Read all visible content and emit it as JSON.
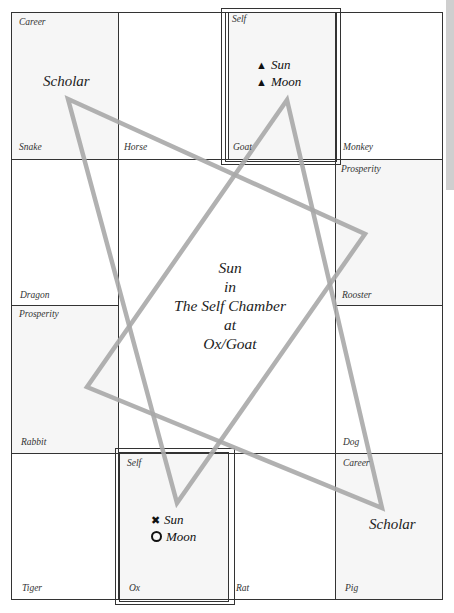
{
  "grid": {
    "cells": [
      {
        "animal": "Snake",
        "chamber": "Career"
      },
      {
        "animal": "Horse",
        "chamber": ""
      },
      {
        "animal": "Goat",
        "chamber": "Self"
      },
      {
        "animal": "Monkey",
        "chamber": ""
      },
      {
        "animal": "Dragon",
        "chamber": ""
      },
      {
        "animal": "Rooster",
        "chamber": "Prosperity"
      },
      {
        "animal": "Rabbit",
        "chamber": "Prosperity"
      },
      {
        "animal": "Dog",
        "chamber": ""
      },
      {
        "animal": "Tiger",
        "chamber": ""
      },
      {
        "animal": "Ox",
        "chamber": "Self"
      },
      {
        "animal": "Rat",
        "chamber": ""
      },
      {
        "animal": "Pig",
        "chamber": "Career"
      }
    ]
  },
  "scholar_top": "Scholar",
  "scholar_bottom": "Scholar",
  "goat_planets": [
    {
      "symbol": "▲",
      "name": "Sun"
    },
    {
      "symbol": "▲",
      "name": "Moon"
    }
  ],
  "ox_planets": [
    {
      "symbol": "✖",
      "name": "Sun"
    },
    {
      "symbol": "ring",
      "name": "Moon"
    }
  ],
  "center_text": [
    "Sun",
    "in",
    "The Self Chamber",
    "at",
    "Ox/Goat"
  ],
  "colors": {
    "star_lines": "#a8a8a8",
    "grid_lines": "#333333",
    "shaded_cells": "#f6f6f6",
    "side_bar": "#cfcfcf"
  }
}
